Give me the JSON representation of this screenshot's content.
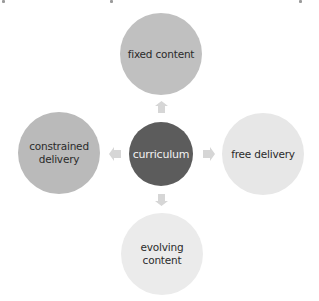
{
  "diagram": {
    "type": "radial",
    "center": {
      "label": "curriculum",
      "color": "#5c5c5c"
    },
    "nodes": [
      {
        "position": "top",
        "label": "fixed content",
        "color": "#c0c0c0"
      },
      {
        "position": "left",
        "label": "constrained delivery",
        "color": "#bababa"
      },
      {
        "position": "right",
        "label": "free delivery",
        "color": "#e7e7e7"
      },
      {
        "position": "bottom",
        "label": "evolving content",
        "color": "#ebebeb"
      }
    ],
    "arrow_color": "#d6d6d6",
    "arrows": [
      "up",
      "left",
      "right",
      "down"
    ]
  }
}
